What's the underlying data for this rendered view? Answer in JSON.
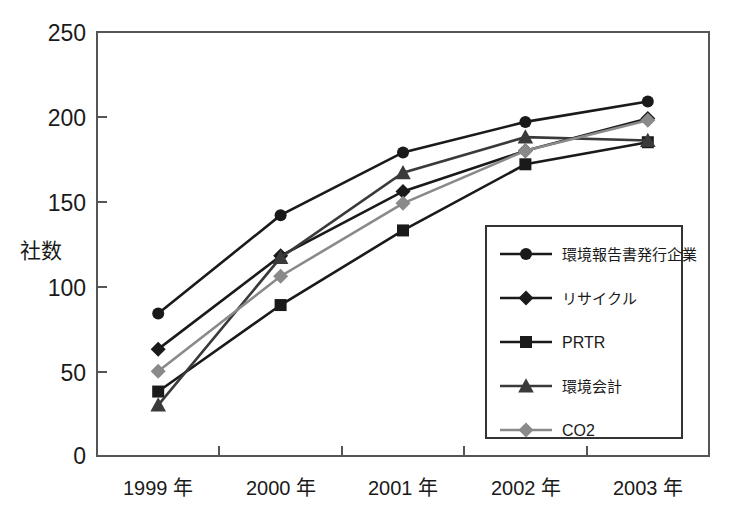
{
  "chart_data": {
    "type": "line",
    "title": "",
    "xlabel": "",
    "ylabel": "社数",
    "ylim": [
      0,
      250
    ],
    "yticks": [
      0,
      50,
      100,
      150,
      200,
      250
    ],
    "grid": false,
    "legend_position": "inside-right",
    "categories": [
      "1999 年",
      "2000 年",
      "2001 年",
      "2002 年",
      "2003 年"
    ],
    "series": [
      {
        "name": "環境報告書発行企業",
        "marker": "circle",
        "color": "#1a1a1a",
        "values": [
          84,
          142,
          179,
          197,
          209
        ]
      },
      {
        "name": "リサイクル",
        "marker": "diamond",
        "color": "#1a1a1a",
        "values": [
          63,
          118,
          156,
          180,
          199
        ]
      },
      {
        "name": "PRTR",
        "marker": "square",
        "color": "#1a1a1a",
        "values": [
          38,
          89,
          133,
          172,
          185
        ]
      },
      {
        "name": "環境会計",
        "marker": "triangle",
        "color": "#3a3a3a",
        "values": [
          30,
          117,
          167,
          188,
          186
        ]
      },
      {
        "name": "CO2",
        "marker": "diamond",
        "color": "#8a8a8a",
        "values": [
          50,
          106,
          149,
          180,
          198
        ]
      }
    ]
  },
  "axis": {
    "y_title": "社数",
    "y_ticks": [
      "250",
      "200",
      "150",
      "100",
      "50",
      "0"
    ],
    "x_ticks": [
      "1999 年",
      "2000 年",
      "2001 年",
      "2002 年",
      "2003 年"
    ]
  },
  "legend": {
    "entries": [
      {
        "label": "環境報告書発行企業",
        "marker": "circle-marker",
        "color": "#1a1a1a"
      },
      {
        "label": "リサイクル",
        "marker": "diamond-marker",
        "color": "#1a1a1a"
      },
      {
        "label": "PRTR",
        "marker": "square-marker",
        "color": "#1a1a1a"
      },
      {
        "label": "環境会計",
        "marker": "triangle-marker",
        "color": "#3a3a3a"
      },
      {
        "label": "CO2",
        "marker": "diamond-marker",
        "color": "#8a8a8a"
      }
    ]
  },
  "colors": {
    "axis": "#555555",
    "plot_background": "#ffffff",
    "series_black": "#1a1a1a",
    "series_gray": "#8a8a8a"
  }
}
